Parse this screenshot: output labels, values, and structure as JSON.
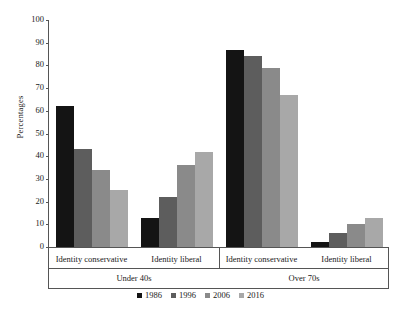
{
  "chart_data": {
    "type": "bar",
    "title": "",
    "xlabel": "",
    "ylabel": "Percentages",
    "ylim": [
      0,
      100
    ],
    "ytick_values": [
      0,
      10,
      20,
      30,
      40,
      50,
      60,
      70,
      80,
      90,
      100
    ],
    "ytick_labels": [
      "0",
      "10",
      "20",
      "30",
      "40",
      "50",
      "60",
      "70",
      "80",
      "90",
      "100"
    ],
    "grid": false,
    "legend_position": "bottom",
    "categories": [
      "Identity conservative",
      "Identity liberal",
      "Identity conservative",
      "Identity liberal"
    ],
    "supercategories": [
      "Under 40s",
      "Over 70s"
    ],
    "series": [
      {
        "name": "1986",
        "color": "#141414",
        "values": [
          62,
          13,
          87,
          2
        ]
      },
      {
        "name": "1996",
        "color": "#5d5d5d",
        "values": [
          43,
          22,
          84,
          6
        ]
      },
      {
        "name": "2006",
        "color": "#8a8a8a",
        "values": [
          34,
          36,
          79,
          10
        ]
      },
      {
        "name": "2016",
        "color": "#a8a8a8",
        "values": [
          25,
          42,
          67,
          13
        ]
      }
    ]
  },
  "axis": {
    "y_label": "Percentages",
    "y_ticks": [
      "100",
      "90",
      "80",
      "70",
      "60",
      "50",
      "40",
      "30",
      "20",
      "10",
      "0"
    ]
  },
  "categories": [
    {
      "label": "Identity conservative",
      "group": "Under 40s"
    },
    {
      "label": "Identity liberal",
      "group": "Under 40s"
    },
    {
      "label": "Identity conservative",
      "group": "Over 70s"
    },
    {
      "label": "Identity liberal",
      "group": "Over 70s"
    }
  ],
  "groups": [
    {
      "label": "Under 40s"
    },
    {
      "label": "Over 70s"
    }
  ],
  "legend": {
    "items": [
      {
        "label": "1986",
        "color": "#141414"
      },
      {
        "label": "1996",
        "color": "#5d5d5d"
      },
      {
        "label": "2006",
        "color": "#8a8a8a"
      },
      {
        "label": "2016",
        "color": "#a8a8a8"
      }
    ]
  }
}
